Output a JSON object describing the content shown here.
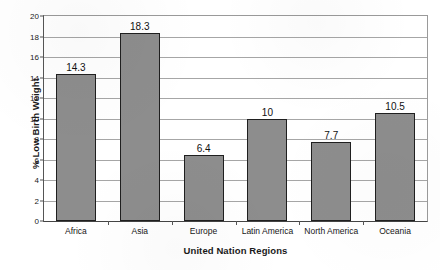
{
  "chart_data": {
    "type": "bar",
    "title": "",
    "subtitle": "",
    "xlabel": "United Nation Regions",
    "ylabel": "% Low Birth Weight",
    "categories": [
      "Africa",
      "Asia",
      "Europe",
      "Latin America",
      "North America",
      "Oceania"
    ],
    "values": [
      14.3,
      18.3,
      6.4,
      10,
      7.7,
      10.5
    ],
    "value_labels": [
      "14.3",
      "18.3",
      "6.4",
      "10",
      "7.7",
      "10.5"
    ],
    "ylim": [
      0,
      20
    ],
    "ytick_step": 2,
    "ytick_labels": [
      "0",
      "2",
      "4",
      "6",
      "8",
      "10",
      "12",
      "14",
      "16",
      "18",
      "20"
    ],
    "grid": true,
    "grid_axis": "y",
    "legend": false,
    "legend_position": "none",
    "bar_fill_color": "#8d8d8d",
    "bar_edge_color": "#1f1f1f",
    "gridline_color": "#a6a6a6",
    "frame_color": "#9a9a9a",
    "background_color": "#ffffff",
    "text_color": "#1a1a1a"
  }
}
